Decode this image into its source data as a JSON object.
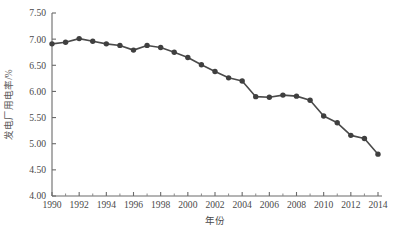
{
  "chart_data": {
    "type": "line",
    "title": "",
    "xlabel": "年份",
    "ylabel": "发电厂用电率/%",
    "xlim": [
      1990,
      2014
    ],
    "ylim": [
      4.0,
      7.5
    ],
    "grid": false,
    "legend": "none",
    "marker": "circle",
    "line_color": "#4a4a4a",
    "marker_color": "#3f3f3f",
    "x": [
      1990,
      1991,
      1992,
      1993,
      1994,
      1995,
      1996,
      1997,
      1998,
      1999,
      2000,
      2001,
      2002,
      2003,
      2004,
      2005,
      2006,
      2007,
      2008,
      2009,
      2010,
      2011,
      2012,
      2013,
      2014
    ],
    "values": [
      6.91,
      6.94,
      7.01,
      6.96,
      6.91,
      6.88,
      6.79,
      6.88,
      6.84,
      6.75,
      6.65,
      6.51,
      6.38,
      6.26,
      6.2,
      5.9,
      5.89,
      5.93,
      5.91,
      5.83,
      5.53,
      5.4,
      5.16,
      5.1,
      4.8
    ],
    "x_ticks": [
      "1990",
      "1992",
      "1994",
      "1996",
      "1998",
      "2000",
      "2002",
      "2004",
      "2006",
      "2008",
      "2010",
      "2012",
      "2014"
    ],
    "x_tick_values": [
      1990,
      1992,
      1994,
      1996,
      1998,
      2000,
      2002,
      2004,
      2006,
      2008,
      2010,
      2012,
      2014
    ],
    "y_ticks": [
      "4.00",
      "4.50",
      "5.00",
      "5.50",
      "6.00",
      "6.50",
      "7.00",
      "7.50"
    ],
    "y_tick_values": [
      4.0,
      4.5,
      5.0,
      5.5,
      6.0,
      6.5,
      7.0,
      7.5
    ],
    "minor_x_ticks": true
  },
  "caption": {
    "text": ""
  }
}
